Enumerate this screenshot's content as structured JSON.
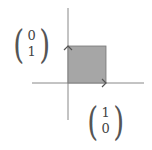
{
  "diagram": {
    "colors": {
      "square_fill": "#a6a6a6",
      "square_stroke": "#777777",
      "axis": "#888888",
      "arrow": "#555555"
    },
    "vector_y": {
      "label": "e2",
      "top": "0",
      "bottom": "1"
    },
    "vector_x": {
      "label": "e1",
      "top": "1",
      "bottom": "0"
    }
  }
}
